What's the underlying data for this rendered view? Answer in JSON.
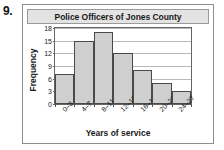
{
  "problem": {
    "number": "9."
  },
  "chart_data": {
    "type": "bar",
    "title": "Police Officers of Jones County",
    "xlabel": "Years of service",
    "ylabel": "Frequency",
    "categories": [
      "0–3",
      "4–7",
      "8–11",
      "12–15",
      "16–19",
      "20–23",
      "24–27"
    ],
    "values": [
      7,
      15,
      17,
      12,
      8,
      5,
      3
    ],
    "ylim": [
      0,
      18
    ],
    "yticks": [
      0,
      3,
      6,
      9,
      12,
      15,
      18
    ],
    "ytick_labels": [
      "0",
      "3",
      "6",
      "9",
      "12",
      "15",
      "18"
    ],
    "grid": true,
    "legend": "none",
    "colors": {
      "bar_fill": "#cfcfcf",
      "bar_border": "#4a4a4a",
      "gridline": "#b9b9b9",
      "axis": "#666666",
      "title_bar_bg": "#e3e3e3",
      "text": "#1a1a1a"
    }
  }
}
